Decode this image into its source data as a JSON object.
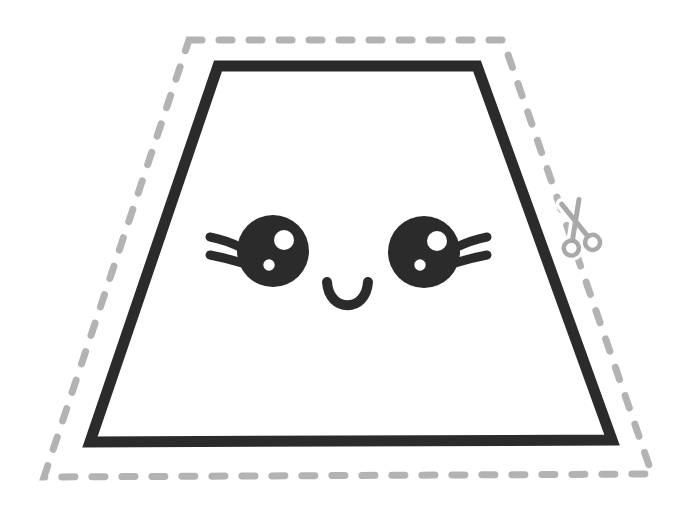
{
  "figure": {
    "kind": "trapezoid-cutout-template",
    "background": "#ffffff",
    "cut_line": {
      "color": "#b3b3b3",
      "stroke_width": 7,
      "dash_pattern": "13 17",
      "points": "189,40 503,40 652,474 44,477"
    },
    "shape": {
      "kind": "trapezoid",
      "outline_color": "#2b2b2b",
      "stroke_width": 11,
      "fill": "#ffffff",
      "points": "218,66 477,66 612,440 90,442"
    },
    "face": {
      "color": "#2b2b2b",
      "highlight_color": "#ffffff",
      "lash_width": 9,
      "left_eye": {
        "cx": 273,
        "cy": 251,
        "rx": 36,
        "ry": 36,
        "big_highlight": {
          "cx": 284,
          "cy": 240,
          "r": 10
        },
        "small_highlight": {
          "cx": 269,
          "cy": 265,
          "r": 5.7
        },
        "upper_lash_d": "M 242 248 Q 226 240 210 237",
        "lower_lash_d": "M 242 263 Q 226 258 210 255"
      },
      "right_eye": {
        "cx": 424,
        "cy": 252,
        "rx": 36,
        "ry": 36,
        "big_highlight": {
          "cx": 437,
          "cy": 241,
          "r": 10
        },
        "small_highlight": {
          "cx": 420,
          "cy": 265,
          "r": 5.7
        },
        "upper_lash_d": "M 455 248 Q 471 240 487 237",
        "lower_lash_d": "M 455 263 Q 471 258 487 255"
      },
      "smile": {
        "d": "M 327 282 C 329 313, 366 313, 368 282",
        "stroke_width": 10
      }
    },
    "scissors": {
      "icon": "scissors-icon",
      "color": "#a9a9a9",
      "transform": "translate(576 223) rotate(-15)",
      "blade1_d": "M -9 -22 L 8 16",
      "blade2_d": "M 9 -22 L -8 16",
      "ring1": {
        "cx": -11,
        "cy": 23,
        "r": 7.5
      },
      "ring2": {
        "cx": 11,
        "cy": 23,
        "r": 7.5
      },
      "blade_width": 5,
      "ring_width": 4.5
    }
  }
}
